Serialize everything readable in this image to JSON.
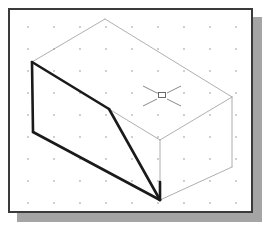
{
  "window": {
    "title": "Isometric Drawing View",
    "border_color": "#3a3a3a",
    "shadow_color": "#a5a5a5",
    "background_color": "#ffffff"
  },
  "grid": {
    "name": "snap-dot-grid",
    "dot_color": "#d8c9cc",
    "spacing_x": 26,
    "spacing_y": 22,
    "visible": "true"
  },
  "drawing": {
    "type": "isometric-solid",
    "description": "Rectangular block with angled chamfer cut on the front-left",
    "visible_edge_color": "#1a1a1a",
    "hidden_edge_color": "#9a9a9a",
    "thick_line_width": "2.6",
    "thin_line_width": "0.8",
    "vertices": {
      "top_back_left": "22,52",
      "top_back_peak": "95,9",
      "top_right": "222,87",
      "top_front_mid": "99,99",
      "left_bottom": "23,122",
      "front_bottom": "150,190",
      "right_bottom": "222,157",
      "chamfer_knee": "99,99"
    },
    "faces": [
      {
        "name": "top-face",
        "shading": "none"
      },
      {
        "name": "left-face",
        "shading": "none"
      },
      {
        "name": "angled-chamfer-face",
        "shading": "none"
      },
      {
        "name": "right-side-face",
        "shading": "none"
      }
    ]
  },
  "cursor": {
    "name": "crosshair-pick-box-cursor",
    "center_x": 152,
    "center_y": 86,
    "arm_length": 19,
    "pick_box_size": 7,
    "color": "#6b6b6b"
  }
}
